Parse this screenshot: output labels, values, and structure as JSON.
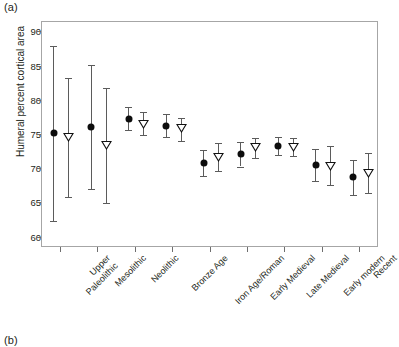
{
  "figure": {
    "panel_a_label": "(a)",
    "panel_b_label": "(b)"
  },
  "chart_data": {
    "type": "scatter",
    "title": "",
    "xlabel": "",
    "ylabel": "Humeral percent cortical area",
    "ylim": [
      58.5,
      91.5
    ],
    "yticks": [
      60,
      65,
      70,
      75,
      80,
      85,
      90
    ],
    "ytick_labels": [
      "60",
      "65",
      "70",
      "75",
      "80",
      "85",
      "90"
    ],
    "grid": false,
    "legend": "none",
    "categories": [
      "Upper\nPaleolithic",
      "Mesolithic",
      "Neolithic",
      "Bronze Age",
      "Iron Age/Roman",
      "Early Medieval",
      "Late Medieval",
      "Early modern",
      "Recent"
    ],
    "category_labels_flat": [
      "Upper Paleolithic",
      "Mesolithic",
      "Neolithic",
      "Bronze Age",
      "Iron Age/Roman",
      "Early Medieval",
      "Late Medieval",
      "Early modern",
      "Recent"
    ],
    "series": [
      {
        "name": "males",
        "marker": "filled-circle",
        "values": [
          75.3,
          76.1,
          77.4,
          76.3,
          70.9,
          72.2,
          73.4,
          70.6,
          68.8
        ],
        "ci_low": [
          62.4,
          67.1,
          75.7,
          74.7,
          69.0,
          70.4,
          72.1,
          68.3,
          66.2
        ],
        "ci_high": [
          88.0,
          85.2,
          79.1,
          78.0,
          72.8,
          74.0,
          74.7,
          72.9,
          71.4
        ]
      },
      {
        "name": "females",
        "marker": "open-triangle-down",
        "values": [
          74.7,
          73.5,
          76.6,
          76.0,
          71.8,
          73.3,
          73.3,
          70.5,
          69.4
        ],
        "ci_low": [
          65.9,
          65.0,
          75.0,
          74.1,
          69.7,
          71.6,
          71.9,
          67.7,
          66.6
        ],
        "ci_high": [
          83.3,
          81.9,
          78.3,
          77.5,
          73.9,
          74.6,
          74.6,
          73.4,
          72.3
        ]
      }
    ]
  }
}
